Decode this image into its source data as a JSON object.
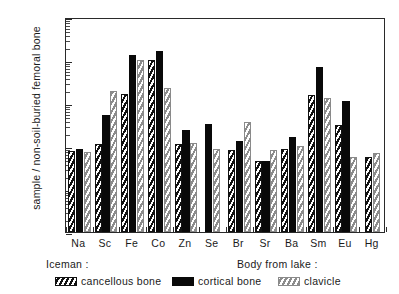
{
  "chart_data": {
    "type": "bar",
    "title": "",
    "xlabel": "",
    "ylabel": "sample / non-soil-buried femoral bone",
    "yscale": "log",
    "ylim": [
      0.01,
      1000
    ],
    "ytick_labels": [
      "1000",
      "100",
      "10",
      "1",
      "0.1",
      "0.01"
    ],
    "ytick_values": [
      1000,
      100,
      10,
      1,
      0.1,
      0.01
    ],
    "grid": false,
    "legend_position": "below-axes",
    "categories": [
      "Na",
      "Sc",
      "Fe",
      "Co",
      "Zn",
      "Se",
      "Br",
      "Sr",
      "Ba",
      "Sm",
      "Eu",
      "Hg"
    ],
    "series": [
      {
        "name": "cancellous bone",
        "group": "Iceman",
        "fill": "black-diagonal-hatch",
        "values": [
          0.75,
          1.1,
          16.0,
          100.0,
          1.1,
          null,
          0.8,
          0.45,
          0.85,
          15.0,
          3.0,
          0.55
        ]
      },
      {
        "name": "cortical bone",
        "group": "Iceman",
        "fill": "solid-black",
        "values": [
          0.85,
          5.2,
          130.0,
          160.0,
          2.4,
          3.3,
          1.3,
          0.45,
          1.6,
          70.0,
          11.0,
          null
        ]
      },
      {
        "name": "clavicle",
        "group": "Body from lake",
        "fill": "gray-diagonal-hatch",
        "values": [
          0.72,
          19.0,
          100.0,
          22.0,
          1.15,
          0.85,
          3.6,
          0.8,
          1.0,
          13.0,
          0.55,
          0.7
        ]
      }
    ]
  },
  "legend": {
    "group_left_heading": "Iceman :",
    "group_right_heading": "Body from lake :",
    "entries": [
      {
        "label": "cancellous bone"
      },
      {
        "label": "cortical bone"
      },
      {
        "label": "clavicle"
      }
    ]
  }
}
